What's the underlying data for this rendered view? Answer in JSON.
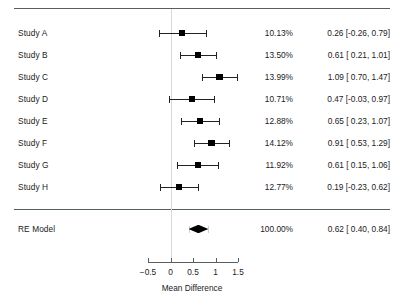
{
  "figure": {
    "type": "forest-plot",
    "xlabel": "Mean Difference",
    "columns": {
      "study": "Study",
      "weight": "Weight",
      "estimate": "Estimate [95% CI]"
    }
  },
  "axis": {
    "ticks": [
      "-0.5",
      "0",
      "0.5",
      "1",
      "1.5"
    ],
    "tick_values": [
      -0.5,
      0,
      0.5,
      1,
      1.5
    ],
    "min": -0.5,
    "max": 1.5,
    "reference_line": 0
  },
  "rows": [
    {
      "label": "Study A",
      "weight": "10.13%",
      "estimate": "0.26 [-0.26, 0.79]",
      "est": 0.26,
      "lo": -0.26,
      "hi": 0.79,
      "w": 10.13
    },
    {
      "label": "Study B",
      "weight": "13.50%",
      "estimate": "0.61 [ 0.21, 1.01]",
      "est": 0.61,
      "lo": 0.21,
      "hi": 1.01,
      "w": 13.5
    },
    {
      "label": "Study C",
      "weight": "13.99%",
      "estimate": "1.09 [ 0.70, 1.47]",
      "est": 1.09,
      "lo": 0.7,
      "hi": 1.47,
      "w": 13.99
    },
    {
      "label": "Study D",
      "weight": "10.71%",
      "estimate": "0.47 [-0.03, 0.97]",
      "est": 0.47,
      "lo": -0.03,
      "hi": 0.97,
      "w": 10.71
    },
    {
      "label": "Study E",
      "weight": "12.88%",
      "estimate": "0.65 [ 0.23, 1.07]",
      "est": 0.65,
      "lo": 0.23,
      "hi": 1.07,
      "w": 12.88
    },
    {
      "label": "Study F",
      "weight": "14.12%",
      "estimate": "0.91 [ 0.53, 1.29]",
      "est": 0.91,
      "lo": 0.53,
      "hi": 1.29,
      "w": 14.12
    },
    {
      "label": "Study G",
      "weight": "11.92%",
      "estimate": "0.61 [ 0.15, 1.06]",
      "est": 0.61,
      "lo": 0.15,
      "hi": 1.06,
      "w": 11.92
    },
    {
      "label": "Study H",
      "weight": "12.77%",
      "estimate": "0.19 [-0.23, 0.62]",
      "est": 0.19,
      "lo": -0.23,
      "hi": 0.62,
      "w": 12.77
    }
  ],
  "summary": {
    "label": "RE Model",
    "weight": "100.00%",
    "estimate": "0.62 [ 0.40, 0.84]",
    "est": 0.62,
    "lo": 0.4,
    "hi": 0.84
  },
  "chart_data": {
    "type": "forest",
    "title": "",
    "xlabel": "Mean Difference",
    "ylabel": "",
    "xlim": [
      -0.5,
      1.5
    ],
    "xticks": [
      -0.5,
      0,
      0.5,
      1,
      1.5
    ],
    "grid": false,
    "reference_line": 0,
    "categories": [
      "Study A",
      "Study B",
      "Study C",
      "Study D",
      "Study E",
      "Study F",
      "Study G",
      "Study H",
      "RE Model"
    ],
    "values": [
      0.26,
      0.61,
      1.09,
      0.47,
      0.65,
      0.91,
      0.61,
      0.19,
      0.62
    ],
    "ci_lower": [
      -0.26,
      0.21,
      0.7,
      -0.03,
      0.23,
      0.53,
      0.15,
      -0.23,
      0.4
    ],
    "ci_upper": [
      0.79,
      1.01,
      1.47,
      0.97,
      1.07,
      1.29,
      1.06,
      0.62,
      0.84
    ],
    "weights": [
      10.13,
      13.5,
      13.99,
      10.71,
      12.88,
      14.12,
      11.92,
      12.77,
      100.0
    ],
    "summary_index": 8,
    "annotations": [
      "10.13%",
      "13.50%",
      "13.99%",
      "10.71%",
      "12.88%",
      "14.12%",
      "11.92%",
      "12.77%",
      "100.00%"
    ]
  },
  "colors": {
    "marker": "#000000",
    "line": "#222222",
    "rule": "#555f63",
    "reference": "#d8d8d8",
    "text": "#1a1a1a"
  }
}
